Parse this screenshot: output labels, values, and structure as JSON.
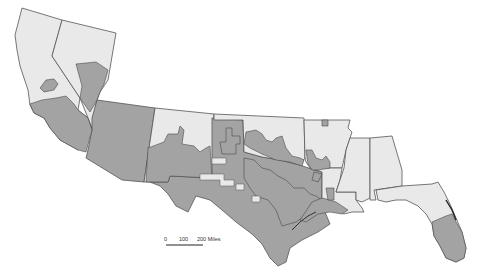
{
  "map": {
    "title": "",
    "colors": {
      "background": "#ffffff",
      "state_fill": "#e9e9e9",
      "region_fill": "#a3a3a3",
      "border": "#555555"
    },
    "states": [
      {
        "id": "california",
        "name": "California"
      },
      {
        "id": "nevada",
        "name": "Nevada"
      },
      {
        "id": "arizona",
        "name": "Arizona"
      },
      {
        "id": "new-mexico",
        "name": "New Mexico"
      },
      {
        "id": "texas",
        "name": "Texas"
      },
      {
        "id": "oklahoma",
        "name": "Oklahoma"
      },
      {
        "id": "arkansas",
        "name": "Arkansas"
      },
      {
        "id": "louisiana",
        "name": "Louisiana"
      },
      {
        "id": "mississippi",
        "name": "Mississippi"
      },
      {
        "id": "alabama",
        "name": "Alabama"
      },
      {
        "id": "florida",
        "name": "Florida"
      }
    ],
    "scale_bar": {
      "labels": [
        "0",
        "100",
        "200 Miles"
      ]
    }
  }
}
